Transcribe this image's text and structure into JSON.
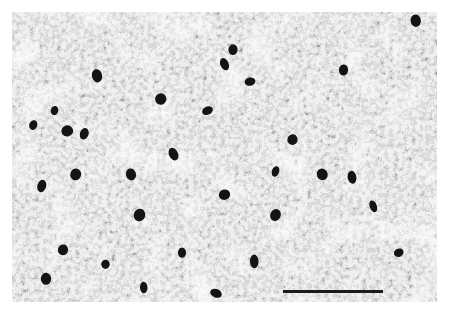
{
  "image": {
    "description": "Grayscale light micrograph of stained neural tissue showing dense neuropil with scattered darkly stained cell bodies",
    "colors": {
      "background": "#ffffff",
      "tissue_light": "#e9e9e9",
      "stain_dark": "#141414"
    },
    "scale_bar": {
      "label": ""
    },
    "cells": [
      {
        "x": 0.2,
        "y": 0.22
      },
      {
        "x": 0.1,
        "y": 0.34
      },
      {
        "x": 0.05,
        "y": 0.39
      },
      {
        "x": 0.17,
        "y": 0.42
      },
      {
        "x": 0.13,
        "y": 0.41
      },
      {
        "x": 0.52,
        "y": 0.13
      },
      {
        "x": 0.5,
        "y": 0.18
      },
      {
        "x": 0.56,
        "y": 0.24
      },
      {
        "x": 0.78,
        "y": 0.2
      },
      {
        "x": 0.95,
        "y": 0.03
      },
      {
        "x": 0.46,
        "y": 0.34
      },
      {
        "x": 0.38,
        "y": 0.49
      },
      {
        "x": 0.15,
        "y": 0.56
      },
      {
        "x": 0.07,
        "y": 0.6
      },
      {
        "x": 0.28,
        "y": 0.56
      },
      {
        "x": 0.3,
        "y": 0.7
      },
      {
        "x": 0.12,
        "y": 0.82
      },
      {
        "x": 0.22,
        "y": 0.87
      },
      {
        "x": 0.4,
        "y": 0.83
      },
      {
        "x": 0.5,
        "y": 0.63
      },
      {
        "x": 0.62,
        "y": 0.7
      },
      {
        "x": 0.85,
        "y": 0.67
      },
      {
        "x": 0.8,
        "y": 0.57
      },
      {
        "x": 0.62,
        "y": 0.55
      },
      {
        "x": 0.91,
        "y": 0.83
      },
      {
        "x": 0.57,
        "y": 0.86
      },
      {
        "x": 0.08,
        "y": 0.92
      },
      {
        "x": 0.31,
        "y": 0.95
      },
      {
        "x": 0.48,
        "y": 0.97
      },
      {
        "x": 0.73,
        "y": 0.56
      },
      {
        "x": 0.35,
        "y": 0.3
      },
      {
        "x": 0.66,
        "y": 0.44
      }
    ]
  }
}
